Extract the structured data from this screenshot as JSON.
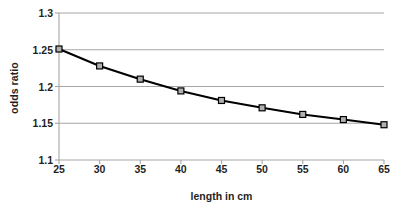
{
  "chart_data": {
    "type": "line",
    "title": "",
    "xlabel": "length in cm",
    "ylabel": "odds ratio",
    "x": [
      25,
      30,
      35,
      40,
      45,
      50,
      55,
      60,
      65
    ],
    "values": [
      1.251,
      1.228,
      1.21,
      1.194,
      1.181,
      1.171,
      1.162,
      1.155,
      1.148
    ],
    "series": [
      {
        "name": "odds ratio",
        "values": [
          1.251,
          1.228,
          1.21,
          1.194,
          1.181,
          1.171,
          1.162,
          1.155,
          1.148
        ]
      }
    ],
    "xlim": [
      25,
      65
    ],
    "ylim": [
      1.1,
      1.3
    ],
    "xticks": [
      25,
      30,
      35,
      40,
      45,
      50,
      55,
      60,
      65
    ],
    "yticks": [
      1.1,
      1.15,
      1.2,
      1.25,
      1.3
    ],
    "xtick_labels": [
      "25",
      "30",
      "35",
      "40",
      "45",
      "50",
      "55",
      "60",
      "65"
    ],
    "ytick_labels": [
      "1.1",
      "1.15",
      "1.2",
      "1.25",
      "1.3"
    ],
    "grid": "horizontal",
    "legend": "none",
    "line_color": "#000000",
    "marker": "square",
    "marker_fill": "#b0b0b0",
    "marker_edge": "#000000",
    "gridline_color": "#a6a6a6",
    "axis_color": "#a6a6a6",
    "background": "#ffffff"
  }
}
